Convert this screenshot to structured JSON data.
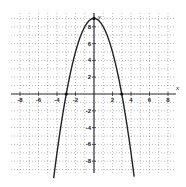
{
  "chart_data": {
    "type": "line",
    "title": "",
    "function": "y = 9 - x^2",
    "xlabel": "x",
    "ylabel": "y",
    "xlim": [
      -9,
      9
    ],
    "ylim": [
      -10,
      9.5
    ],
    "grid": true,
    "x_tick_labels": [
      "-8",
      "-6",
      "-4",
      "-2",
      "2",
      "4",
      "6",
      "8"
    ],
    "y_tick_labels": [
      "8",
      "6",
      "4",
      "2",
      "-2",
      "-4",
      "-6",
      "-8"
    ],
    "series": [
      {
        "name": "parabola",
        "x": [
          -4.36,
          -4,
          -3,
          -2,
          -1,
          0,
          1,
          2,
          3,
          4,
          4.36
        ],
        "y": [
          -10,
          -7,
          0,
          5,
          8,
          9,
          8,
          5,
          0,
          -7,
          -10
        ]
      }
    ],
    "marked_points": [
      {
        "x": -3,
        "y": 0
      },
      {
        "x": 0,
        "y": 9
      },
      {
        "x": 3,
        "y": 0
      }
    ],
    "colors": {
      "curve": "#222222",
      "axis": "#333333",
      "grid": "#888888"
    }
  }
}
